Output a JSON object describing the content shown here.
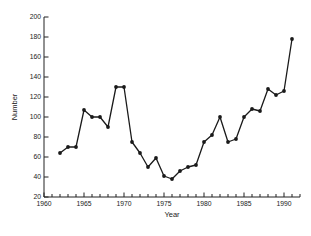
{
  "chart_data": {
    "type": "line",
    "title": "",
    "xlabel": "Year",
    "ylabel": "Number",
    "x": [
      1962,
      1963,
      1964,
      1965,
      1966,
      1967,
      1968,
      1969,
      1970,
      1971,
      1972,
      1973,
      1974,
      1975,
      1976,
      1977,
      1978,
      1979,
      1980,
      1981,
      1982,
      1983,
      1984,
      1985,
      1986,
      1987,
      1988,
      1989,
      1990,
      1991
    ],
    "values": [
      64,
      70,
      70,
      107,
      100,
      100,
      90,
      130,
      130,
      75,
      64,
      50,
      59,
      41,
      38,
      46,
      50,
      52,
      75,
      82,
      100,
      75,
      78,
      100,
      108,
      106,
      128,
      122,
      126,
      178
    ],
    "xlim": [
      1960,
      1992
    ],
    "ylim": [
      20,
      200
    ],
    "x_tick_labels": [
      1960,
      1965,
      1970,
      1975,
      1980,
      1985,
      1990
    ],
    "x_minor_tick_step": 1,
    "y_ticks": [
      20,
      40,
      60,
      80,
      100,
      120,
      140,
      160,
      180,
      200
    ],
    "grid": false,
    "legend": false,
    "marker": "filled-circle",
    "line_color": "#1a1a1a",
    "axis_color": "#222222",
    "background_color": "#ffffff"
  }
}
